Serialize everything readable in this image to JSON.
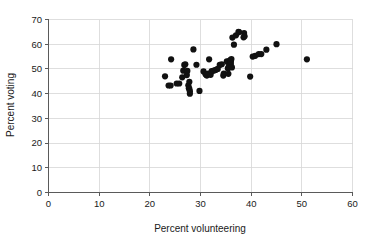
{
  "chart_data": {
    "type": "scatter",
    "title": "",
    "xlabel": "Percent volunteering",
    "ylabel": "Percent voting",
    "xlim": [
      0,
      60
    ],
    "ylim": [
      0,
      70
    ],
    "xticks": [
      0,
      10,
      20,
      30,
      40,
      50,
      60
    ],
    "yticks": [
      0,
      10,
      20,
      30,
      40,
      50,
      60,
      70
    ],
    "xtick_labels": [
      "0",
      "10",
      "20",
      "30",
      "40",
      "50",
      "60"
    ],
    "ytick_labels": [
      "0",
      "10",
      "20",
      "30",
      "40",
      "50",
      "60",
      "70"
    ],
    "grid": true,
    "grid_color": "#d6d6d6",
    "axis_color": "#5a5a5a",
    "point_color": "#111111",
    "background_color": "#ffffff",
    "legend": null,
    "legend_position": "none",
    "marker_size": 3.1,
    "n_points": 64,
    "points": [
      [
        23.0,
        47.0
      ],
      [
        23.7,
        43.3
      ],
      [
        24.1,
        43.3
      ],
      [
        24.2,
        53.9
      ],
      [
        25.3,
        44.1
      ],
      [
        25.8,
        44.1
      ],
      [
        26.4,
        46.6
      ],
      [
        26.6,
        49.3
      ],
      [
        26.8,
        51.6
      ],
      [
        27.0,
        51.9
      ],
      [
        27.3,
        47.5
      ],
      [
        27.4,
        49.2
      ],
      [
        27.6,
        43.4
      ],
      [
        27.7,
        42.2
      ],
      [
        27.8,
        41.9
      ],
      [
        27.8,
        44.8
      ],
      [
        27.9,
        40.0
      ],
      [
        27.9,
        41.0
      ],
      [
        28.6,
        57.9
      ],
      [
        29.2,
        51.7
      ],
      [
        29.8,
        41.1
      ],
      [
        30.6,
        49.0
      ],
      [
        31.0,
        47.8
      ],
      [
        31.2,
        47.4
      ],
      [
        31.3,
        47.4
      ],
      [
        31.5,
        48.1
      ],
      [
        31.7,
        53.9
      ],
      [
        31.9,
        48.0
      ],
      [
        32.0,
        47.6
      ],
      [
        32.2,
        49.1
      ],
      [
        32.6,
        49.3
      ],
      [
        33.0,
        49.6
      ],
      [
        33.4,
        50.0
      ],
      [
        33.8,
        51.6
      ],
      [
        34.2,
        51.9
      ],
      [
        34.5,
        47.3
      ],
      [
        34.6,
        48.1
      ],
      [
        35.2,
        53.1
      ],
      [
        35.3,
        52.9
      ],
      [
        35.4,
        50.2
      ],
      [
        35.5,
        48.0
      ],
      [
        35.6,
        51.0
      ],
      [
        35.8,
        53.4
      ],
      [
        35.9,
        53.6
      ],
      [
        36.0,
        52.0
      ],
      [
        36.0,
        53.0
      ],
      [
        36.1,
        54.0
      ],
      [
        36.2,
        50.6
      ],
      [
        36.3,
        62.7
      ],
      [
        36.6,
        59.8
      ],
      [
        37.0,
        63.6
      ],
      [
        37.5,
        65.0
      ],
      [
        37.6,
        64.9
      ],
      [
        38.5,
        62.8
      ],
      [
        38.6,
        64.5
      ],
      [
        38.7,
        63.2
      ],
      [
        39.8,
        46.9
      ],
      [
        40.3,
        55.0
      ],
      [
        40.8,
        55.3
      ],
      [
        41.5,
        56.0
      ],
      [
        42.0,
        56.0
      ],
      [
        43.0,
        57.8
      ],
      [
        45.0,
        60.0
      ],
      [
        51.0,
        53.9
      ]
    ]
  }
}
